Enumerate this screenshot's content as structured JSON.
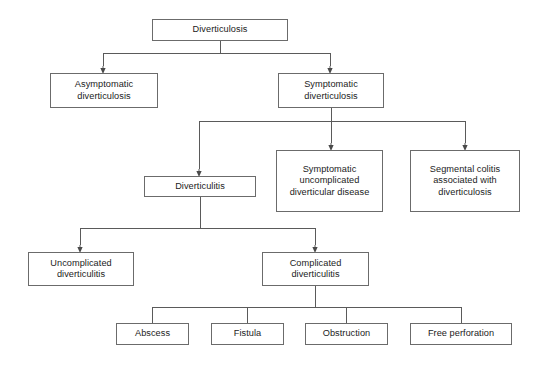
{
  "diagram": {
    "style": {
      "box_border_color": "#6b6b6b",
      "edge_color": "#5a5a5a",
      "text_color": "#1b1b1b",
      "background": "#ffffff"
    },
    "nodes": [
      {
        "id": "diverticulosis",
        "label": "Diverticulosis",
        "x": 152,
        "y": 19,
        "w": 136,
        "h": 22
      },
      {
        "id": "asymptomatic-diverticulosis",
        "label": "Asymptomatic\ndiverticulosis",
        "x": 50,
        "y": 73,
        "w": 108,
        "h": 35
      },
      {
        "id": "symptomatic-diverticulosis",
        "label": "Symptomatic\ndiverticulosis",
        "x": 278,
        "y": 73,
        "w": 106,
        "h": 35
      },
      {
        "id": "diverticulitis",
        "label": "Diverticulitis",
        "x": 144,
        "y": 176,
        "w": 112,
        "h": 21
      },
      {
        "id": "symptomatic-uncomplicated-diverticular-disease",
        "label": "Symptomatic\nuncomplicated\ndiverticular disease",
        "x": 276,
        "y": 150,
        "w": 107,
        "h": 62
      },
      {
        "id": "segmental-colitis-associated-with-diverticulosis",
        "label": "Segmental colitis\nassociated with\ndiverticulosis",
        "x": 410,
        "y": 150,
        "w": 110,
        "h": 62
      },
      {
        "id": "uncomplicated-diverticulitis",
        "label": "Uncomplicated\ndiverticulitis",
        "x": 28,
        "y": 252,
        "w": 106,
        "h": 34
      },
      {
        "id": "complicated-diverticulitis",
        "label": "Complicated\ndiverticulitis",
        "x": 262,
        "y": 252,
        "w": 107,
        "h": 34
      },
      {
        "id": "abscess",
        "label": "Abscess",
        "x": 116,
        "y": 323,
        "w": 73,
        "h": 22
      },
      {
        "id": "fistula",
        "label": "Fistula",
        "x": 211,
        "y": 323,
        "w": 73,
        "h": 22
      },
      {
        "id": "obstruction",
        "label": "Obstruction",
        "x": 305,
        "y": 323,
        "w": 83,
        "h": 22
      },
      {
        "id": "free-perforation",
        "label": "Free perforation",
        "x": 410,
        "y": 323,
        "w": 102,
        "h": 22
      }
    ],
    "edges": [
      {
        "id": "diverticulosis-to-branch-bus",
        "from": "diverticulosis",
        "to": [
          "asymptomatic-diverticulosis",
          "symptomatic-diverticulosis"
        ],
        "bus_y": 53,
        "bus_x1": 103,
        "bus_x2": 330,
        "stem_x": 220,
        "arrows": true
      },
      {
        "id": "symptomatic-to-branch-bus",
        "from": "symptomatic-diverticulosis",
        "to": [
          "diverticulitis",
          "symptomatic-uncomplicated-diverticular-disease",
          "segmental-colitis-associated-with-diverticulosis"
        ],
        "bus_y": 121,
        "bus_x1": 199,
        "bus_x2": 465,
        "stem_x": 331,
        "arrows": true
      },
      {
        "id": "diverticulitis-to-branch-bus",
        "from": "diverticulitis",
        "to": [
          "uncomplicated-diverticulitis",
          "complicated-diverticulitis"
        ],
        "bus_y": 228,
        "bus_x1": 80,
        "bus_x2": 315,
        "stem_x": 200,
        "arrows": true
      },
      {
        "id": "complicated-to-branch-bus",
        "from": "complicated-diverticulitis",
        "to": [
          "abscess",
          "fistula",
          "obstruction",
          "free-perforation"
        ],
        "bus_y": 307,
        "bus_x1": 152,
        "bus_x2": 461,
        "stem_x": 315,
        "arrows": false
      }
    ]
  }
}
